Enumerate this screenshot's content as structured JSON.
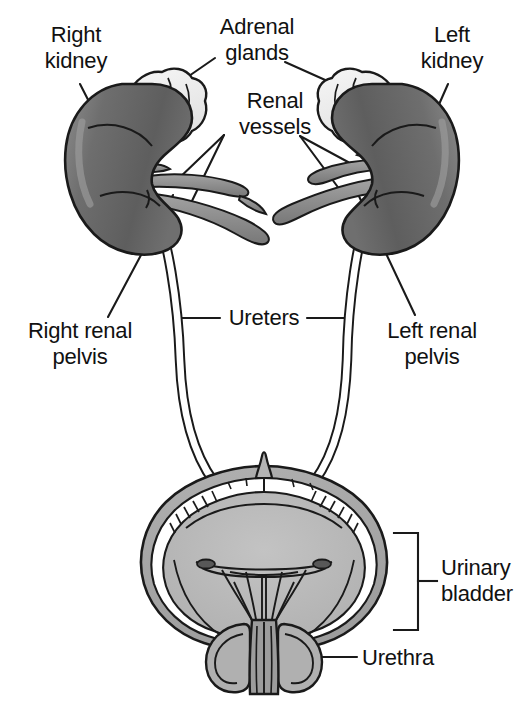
{
  "figure": {
    "view": "anterior coronal cutaway",
    "width": 527,
    "height": 703
  },
  "labels": {
    "right_kidney": "Right\nkidney",
    "adrenal_glands": "Adrenal\nglands",
    "left_kidney": "Left\nkidney",
    "renal_vessels": "Renal\nvessels",
    "right_renal_pelvis": "Right renal\npelvis",
    "ureters": "Ureters",
    "left_renal_pelvis": "Left renal\npelvis",
    "urinary_bladder": "Urinary\nbladder",
    "urethra": "Urethra"
  },
  "structures": [
    {
      "id": "right-kidney",
      "name": "Right kidney",
      "side": "right",
      "count": 1,
      "fill": "#6b6b6b"
    },
    {
      "id": "left-kidney",
      "name": "Left kidney",
      "side": "left",
      "count": 1,
      "fill": "#6b6b6b"
    },
    {
      "id": "adrenal-glands",
      "name": "Adrenal glands",
      "side": "bilateral",
      "count": 2,
      "fill": "#ededed"
    },
    {
      "id": "renal-vessels",
      "name": "Renal vessels",
      "side": "bilateral",
      "count": 4,
      "fill": "#8f8f8f"
    },
    {
      "id": "renal-pelvis",
      "name": "Renal pelvis",
      "side": "bilateral",
      "count": 2,
      "fill": "#ffffff"
    },
    {
      "id": "ureters",
      "name": "Ureters",
      "side": "bilateral",
      "count": 2,
      "fill": "#ffffff"
    },
    {
      "id": "urinary-bladder",
      "name": "Urinary bladder",
      "side": "midline",
      "count": 1,
      "fill": "#b4b4b4"
    },
    {
      "id": "urethra",
      "name": "Urethra",
      "side": "midline",
      "count": 1,
      "fill": "#9a9a9a"
    }
  ],
  "colors": {
    "outline": "#1a1a1a",
    "kidney_fill": "#6b6b6b",
    "kidney_shade": "#555555",
    "kidney_highlight": "#8a8a8a",
    "adrenal_fill": "#ededed",
    "vessel_fill": "#8f8f8f",
    "bladder_outer": "#a8a8a8",
    "bladder_inner": "#b9b9b9",
    "bladder_rim": "#ffffff",
    "tube_fill": "#ffffff",
    "label_text": "#111111",
    "background": "#ffffff"
  }
}
